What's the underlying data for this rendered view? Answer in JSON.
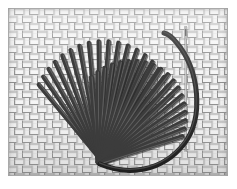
{
  "image": {
    "title": "Embroidered heart of fan stitches on woven fabric",
    "width": 237,
    "height": 189,
    "border_color": "#ffffff",
    "fabric": {
      "name": "woven-basketweave-fabric",
      "base_color": "#e9e9e9",
      "thread_light": "#f4f4f4",
      "thread_dark": "#8a8a8a",
      "shadow_color": "#707070",
      "weave_period_px": 15,
      "band_width_px": 6,
      "rect": {
        "x": 8,
        "y": 8,
        "w": 220,
        "h": 168
      }
    },
    "embroidery": {
      "name": "heart-fan-stitch-motif",
      "floss_color": "#3c3c3c",
      "floss_highlight": "#6e6e6e",
      "floss_shadow": "#232323",
      "left_fan": {
        "name": "left-fan-stitch-cluster",
        "apex_x": 100,
        "apex_y": 163,
        "stitch_count": 19,
        "angle_start_deg": -128,
        "angle_end_deg": -44,
        "radius_min": 92,
        "radius_max": 122
      },
      "right_fan": {
        "name": "right-fan-stitch-cluster",
        "apex_x": 100,
        "apex_y": 163,
        "stitch_count": 19,
        "angle_start_deg": -96,
        "angle_end_deg": -18,
        "radius_min": 78,
        "radius_max": 112
      }
    },
    "thread": {
      "name": "loose-floss-strand",
      "color": "#3c3c3c",
      "width_px": 5,
      "path": "M 100 164 C 128 176, 162 172, 184 144 C 204 118, 200 70, 176 42 C 172 37, 168 34, 164 33"
    },
    "needle": {
      "name": "sewing-needle",
      "color": "#9a9a9a",
      "x": 186,
      "y_top": 26,
      "y_bottom": 152,
      "eye_y": 34,
      "eye_h": 10
    }
  }
}
